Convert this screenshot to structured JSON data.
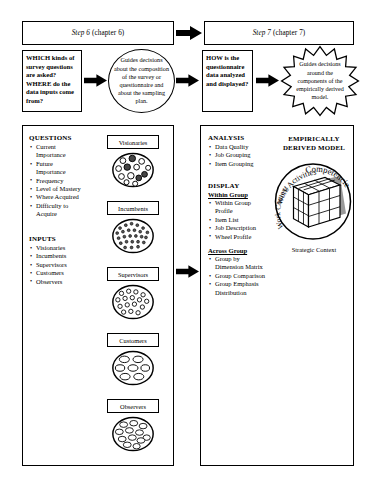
{
  "header": {
    "step_left": {
      "step": "Step 6",
      "chapter": " (chapter 6)"
    },
    "step_right": {
      "step": "Step 7",
      "chapter": " (chapter 7)"
    }
  },
  "flow": {
    "question_box_1": "WHICH kinds of survey questions are asked? WHERE do the data inputs come from?",
    "ellipse_text": "Guides decisions about the composition of the survey or questionnaire and about the sampling plan.",
    "question_box_2": "HOW is the questionnaire data analyzed and displayed?",
    "star_text": "Guides decisions around the components of the empirically derived model.",
    "arrow_1": "arrow-right",
    "arrow_2": "arrow-right",
    "arrow_3": "arrow-right",
    "arrow_4": "arrow-right",
    "arrow_header": "arrow-right",
    "arrow_panels": "arrow-right"
  },
  "left_panel": {
    "questions": {
      "heading": "QUESTIONS",
      "items": [
        "Current\nImportance",
        "Future\nImportance",
        "Frequency",
        "Level of Mastery",
        "Where Acquired",
        "Difficulty to\nAcquire"
      ]
    },
    "inputs": {
      "heading": "INPUTS",
      "items": [
        "Visionaries",
        "Incumbents",
        "Supervisors",
        "Customers",
        "Observers"
      ]
    },
    "groups": [
      {
        "label": "Visionaries",
        "style": "big-dark"
      },
      {
        "label": "Incumbents",
        "style": "tiny-dense"
      },
      {
        "label": "Supervisors",
        "style": "small-open"
      },
      {
        "label": "Customers",
        "style": "oval-few"
      },
      {
        "label": "Observers",
        "style": "oval-many"
      }
    ]
  },
  "right_panel": {
    "analysis": {
      "heading": "ANALYSIS",
      "items": [
        "Data Quality",
        "Job Grouping",
        "Item Grouping"
      ]
    },
    "display": {
      "heading": "DISPLAY",
      "within_group": {
        "subheading": "Within Group",
        "items": [
          "Within Group\nProfile",
          "Item List",
          "Job Description",
          "Wheel Profile"
        ]
      },
      "across_group": {
        "subheading": "Across Group",
        "items": [
          "Group by\nDimension Matrix",
          "Group Comparison",
          "Group Emphasis\nDistribution"
        ]
      }
    },
    "model": {
      "title_line_1": "EMPIRICALLY",
      "title_line_2": "DERIVED MODEL",
      "axis_competencies": "Competencies",
      "axis_work_activities": "Work Activities",
      "axis_work_context": "Work Context",
      "footer": "Strategic Context"
    }
  },
  "colors": {
    "ink": "#000000",
    "paper": "#ffffff"
  }
}
